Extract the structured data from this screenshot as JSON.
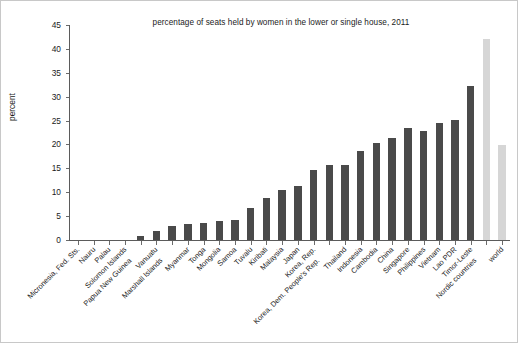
{
  "chart_data": {
    "type": "bar",
    "title": "percentage of seats held by women in the lower or single house, 2011",
    "xlabel": "",
    "ylabel": "percent",
    "ylim": [
      0,
      45
    ],
    "ytick_values": [
      0,
      5,
      10,
      15,
      20,
      25,
      30,
      35,
      40,
      45
    ],
    "ytick_labels": [
      "0",
      "5",
      "10",
      "15",
      "20",
      "25",
      "30",
      "35",
      "40",
      "45"
    ],
    "grid": false,
    "legend": "none",
    "categories": [
      "Micronesia, Fed. Sts.",
      "Nauru",
      "Palau",
      "Solomon Islands",
      "Papua New Guinea",
      "Vanuatu",
      "Marshall Islands",
      "Myanmar",
      "Tonga",
      "Mongolia",
      "Samoa",
      "Tuvalu",
      "Kiribati",
      "Malaysia",
      "Japan",
      "Korea, Rep.",
      "Korea, Dem. People's Rep.",
      "Thailand",
      "Indonesia",
      "Cambodia",
      "China",
      "Singapore",
      "Philippines",
      "Vietnam",
      "Lao PDR",
      "Timor-Leste",
      "Nordic countries",
      "world"
    ],
    "values": [
      0,
      0,
      0,
      0,
      0.9,
      1.9,
      3,
      3.3,
      3.6,
      3.9,
      4.1,
      6.8,
      8.7,
      10.4,
      11.3,
      14.7,
      15.6,
      15.8,
      18.6,
      20.3,
      21.3,
      23.4,
      22.9,
      24.4,
      25.2,
      32.3,
      42,
      19.8
    ],
    "bar_colors": [
      "#4a4a4a",
      "#4a4a4a",
      "#4a4a4a",
      "#4a4a4a",
      "#4a4a4a",
      "#4a4a4a",
      "#4a4a4a",
      "#4a4a4a",
      "#4a4a4a",
      "#4a4a4a",
      "#4a4a4a",
      "#4a4a4a",
      "#4a4a4a",
      "#4a4a4a",
      "#4a4a4a",
      "#4a4a4a",
      "#4a4a4a",
      "#4a4a4a",
      "#4a4a4a",
      "#4a4a4a",
      "#4a4a4a",
      "#4a4a4a",
      "#4a4a4a",
      "#4a4a4a",
      "#4a4a4a",
      "#4a4a4a",
      "#d6d6d6",
      "#d6d6d6"
    ]
  },
  "colors": {
    "bar_primary": "#4a4a4a",
    "bar_highlight": "#d6d6d6",
    "axis": "#5b5b5b",
    "text": "#1b1b1b",
    "background": "#ffffff"
  }
}
